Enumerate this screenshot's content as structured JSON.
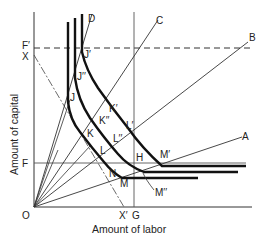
{
  "diagram": {
    "axes": {
      "x_label": "Amount of labor",
      "y_label": "Amount of capital",
      "origin_label": "O"
    },
    "rays": [
      {
        "label": "A",
        "end": [
          242,
          137
        ]
      },
      {
        "label": "B",
        "end": [
          248,
          42
        ]
      },
      {
        "label": "C",
        "end": [
          158,
          20
        ]
      },
      {
        "label": "D",
        "end": [
          92,
          14
        ]
      }
    ],
    "reference_lines": {
      "F_prime": "F′",
      "F": "F",
      "G": "G",
      "X": "X",
      "X_prime": "X′"
    },
    "points": {
      "J": "J",
      "J_double_prime": "J′′",
      "J_prime": "J′",
      "K": "K",
      "K_double_prime": "K′′",
      "K_prime": "K′",
      "L": "L",
      "L_double_prime": "L′′",
      "L_prime": "L′",
      "M": "M",
      "M_double_prime": "M′′",
      "M_prime": "M′",
      "N": "N",
      "H": "H"
    },
    "isoquants": [
      {
        "name": "inner",
        "points": [
          "J",
          "K",
          "L",
          "M"
        ]
      },
      {
        "name": "middle",
        "points": [
          "J′′",
          "K′′",
          "L′′",
          "M′′"
        ]
      },
      {
        "name": "outer",
        "points": [
          "J′",
          "K′",
          "L′",
          "M′"
        ]
      }
    ]
  }
}
